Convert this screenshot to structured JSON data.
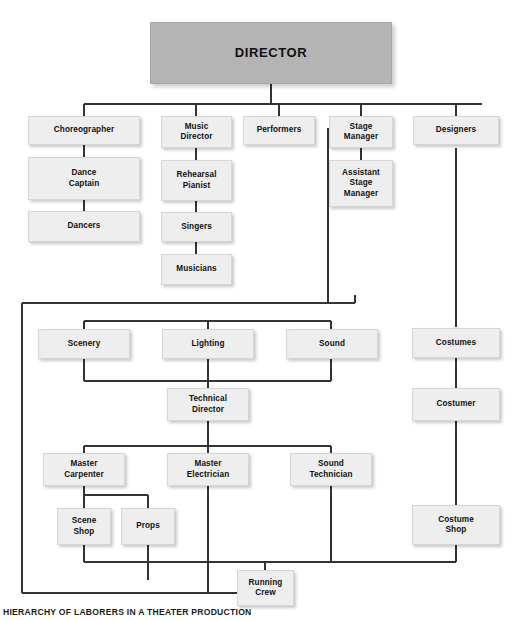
{
  "figure": {
    "title": "DIRECTOR",
    "caption": "HIERARCHY OF LABORERS IN A THEATER PRODUCTION",
    "colors": {
      "root_fill": "#b4b4b4",
      "node_fill": "#eeeeee",
      "node_border": "#d6d6d6",
      "connector": "#333333",
      "text": "#111111",
      "background": "#ffffff"
    }
  },
  "chart_data": {
    "type": "diagram",
    "diagram_type": "organizational-hierarchy-tree",
    "title": "DIRECTOR",
    "caption": "HIERARCHY OF LABORERS IN A THEATER PRODUCTION",
    "orientation": "top-down",
    "root": "DIRECTOR",
    "levels": [
      [
        "DIRECTOR"
      ],
      [
        "Choreographer",
        "Music Director",
        "Performers",
        "Stage Manager",
        "Designers"
      ],
      [
        "Dance Captain",
        "Rehearsal Pianist",
        "Assistant Stage Manager",
        "Scenery",
        "Lighting",
        "Sound",
        "Costumes"
      ],
      [
        "Dancers",
        "Singers",
        "Technical Director",
        "Costumer"
      ],
      [
        "Musicians",
        "Master Carpenter",
        "Master Electrician",
        "Sound Technician"
      ],
      [
        "Scene Shop",
        "Props",
        "Costume Shop"
      ],
      [
        "Running Crew"
      ]
    ],
    "edges": [
      [
        "DIRECTOR",
        "Choreographer"
      ],
      [
        "DIRECTOR",
        "Music Director"
      ],
      [
        "DIRECTOR",
        "Performers"
      ],
      [
        "DIRECTOR",
        "Stage Manager"
      ],
      [
        "DIRECTOR",
        "Designers"
      ],
      [
        "Choreographer",
        "Dance Captain"
      ],
      [
        "Dance Captain",
        "Dancers"
      ],
      [
        "Music Director",
        "Rehearsal Pianist"
      ],
      [
        "Rehearsal Pianist",
        "Singers"
      ],
      [
        "Singers",
        "Musicians"
      ],
      [
        "Stage Manager",
        "Assistant Stage Manager"
      ],
      [
        "Stage Manager",
        "Scenery"
      ],
      [
        "Stage Manager",
        "Lighting"
      ],
      [
        "Stage Manager",
        "Sound"
      ],
      [
        "Designers",
        "Costumes"
      ],
      [
        "Scenery",
        "Technical Director"
      ],
      [
        "Lighting",
        "Technical Director"
      ],
      [
        "Sound",
        "Technical Director"
      ],
      [
        "Costumes",
        "Costumer"
      ],
      [
        "Technical Director",
        "Master Carpenter"
      ],
      [
        "Technical Director",
        "Master Electrician"
      ],
      [
        "Technical Director",
        "Sound Technician"
      ],
      [
        "Master Carpenter",
        "Scene Shop"
      ],
      [
        "Master Carpenter",
        "Props"
      ],
      [
        "Costumer",
        "Costume Shop"
      ],
      [
        "Scene Shop",
        "Running Crew"
      ],
      [
        "Props",
        "Running Crew"
      ],
      [
        "Master Electrician",
        "Running Crew"
      ],
      [
        "Sound Technician",
        "Running Crew"
      ],
      [
        "Costume Shop",
        "Running Crew"
      ],
      [
        "Stage Manager",
        "Running Crew"
      ]
    ]
  },
  "nodes": {
    "director": {
      "label": "DIRECTOR"
    },
    "choreographer": {
      "label": "Choreographer"
    },
    "music_director": {
      "label": "Music\nDirector"
    },
    "performers": {
      "label": "Performers"
    },
    "stage_manager": {
      "label": "Stage\nManager"
    },
    "designers": {
      "label": "Designers"
    },
    "dance_captain": {
      "label": "Dance\nCaptain"
    },
    "dancers": {
      "label": "Dancers"
    },
    "rehearsal_pianist": {
      "label": "Rehearsal\nPianist"
    },
    "singers": {
      "label": "Singers"
    },
    "musicians": {
      "label": "Musicians"
    },
    "assistant_stage_manager": {
      "label": "Assistant\nStage\nManager"
    },
    "scenery": {
      "label": "Scenery"
    },
    "lighting": {
      "label": "Lighting"
    },
    "sound": {
      "label": "Sound"
    },
    "costumes": {
      "label": "Costumes"
    },
    "technical_director": {
      "label": "Technical\nDirector"
    },
    "costumer": {
      "label": "Costumer"
    },
    "master_carpenter": {
      "label": "Master\nCarpenter"
    },
    "master_electrician": {
      "label": "Master\nElectrician"
    },
    "sound_technician": {
      "label": "Sound\nTechnician"
    },
    "scene_shop": {
      "label": "Scene\nShop"
    },
    "props": {
      "label": "Props"
    },
    "costume_shop": {
      "label": "Costume\nShop"
    },
    "running_crew": {
      "label": "Running\nCrew"
    }
  }
}
